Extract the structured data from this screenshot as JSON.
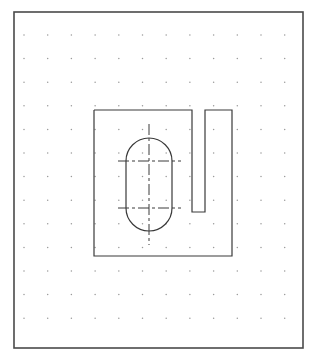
{
  "document": {
    "type": "cad-technical-drawing",
    "title": "2D CAD Sketch — Plate with Obround Slot and U-Channel",
    "background_color": "#ffffff"
  },
  "canvas": {
    "width": 318,
    "height": 361,
    "border": {
      "name": "drawing-frame",
      "x": 14,
      "y": 12,
      "width": 289,
      "height": 336,
      "stroke_color": "#4a4a4a",
      "stroke_width": 1.6,
      "fill": "none"
    },
    "grid": {
      "name": "dot-grid",
      "visible": true,
      "dot_color": "#9a9a9a",
      "dot_radius": 0.75,
      "spacing_x": 23.7,
      "spacing_y": 23.6,
      "origin_x": 24,
      "origin_y": 35,
      "columns": 12,
      "rows": 13
    }
  },
  "geometry": {
    "outline": {
      "name": "part-outline",
      "description": "Rectangular plate profile with open U-shaped channel cut from the top edge",
      "stroke_color": "#3a3a3a",
      "stroke_width": 1.2,
      "fill": "none",
      "points": "94,110 192,110 192,212 205,212 205,110 232,110 232,256 94,256 94,110",
      "bounds": {
        "left": 94,
        "top": 110,
        "right": 232,
        "bottom": 256,
        "width": 138,
        "height": 146
      }
    },
    "channel": {
      "name": "u-channel-slot",
      "description": "Open-ended U slot entering from the top edge of the plate",
      "left_x": 192,
      "right_x": 205,
      "top_y": 110,
      "bottom_y": 212,
      "width": 13,
      "depth": 102
    },
    "obround": {
      "name": "obround-hole",
      "description": "Stadium / slotted hole with semicircular ends",
      "stroke_color": "#3a3a3a",
      "stroke_width": 1.2,
      "fill": "none",
      "left_x": 126,
      "right_x": 172,
      "top_y": 131,
      "bottom_y": 238,
      "width": 46,
      "height": 107,
      "radius": 23,
      "center_x": 149,
      "upper_arc_center_y": 161,
      "lower_arc_center_y": 208,
      "path": "M 126,161 A 23,23 0 0 1 172,161 L 172,208 A 23,23 0 0 1 126,208 Z"
    },
    "centerlines": {
      "name": "center-lines",
      "stroke_color": "#3a3a3a",
      "stroke_width": 1.0,
      "dash_pattern": "11,3,3,3",
      "vertical": {
        "x": 149,
        "y1": 124,
        "y2": 245
      },
      "horizontal_upper": {
        "y": 161,
        "x1": 118,
        "x2": 181
      },
      "horizontal_lower": {
        "y": 208,
        "x1": 118,
        "x2": 181
      }
    }
  },
  "labels": {
    "frame_label": "",
    "annotations": []
  }
}
